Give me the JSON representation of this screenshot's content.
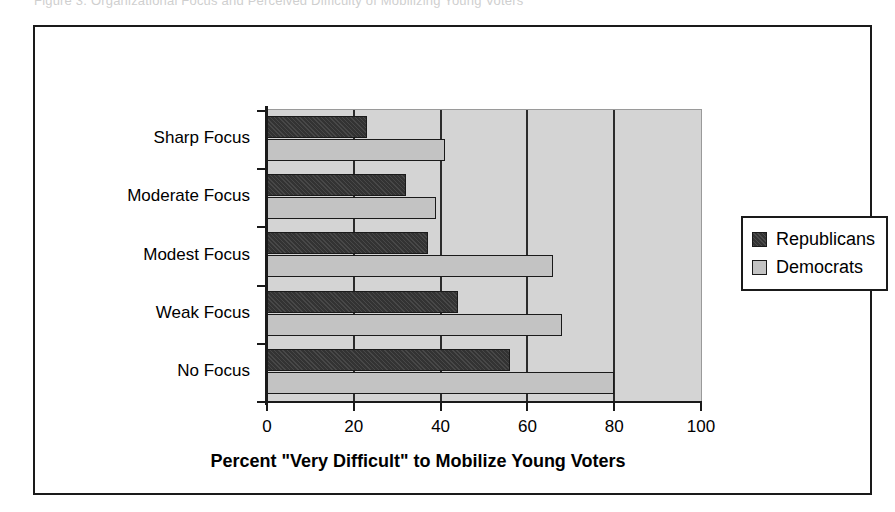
{
  "top_caption": "Figure 3.  Organizational Focus and Perceived Difficulty of Mobilizing Young Voters",
  "chart_data": {
    "type": "bar",
    "orientation": "horizontal",
    "title": "",
    "xlabel": "Percent \"Very Difficult\" to Mobilize Young Voters",
    "ylabel": "",
    "xlim": [
      0,
      100
    ],
    "xticks": [
      0,
      20,
      40,
      60,
      80,
      100
    ],
    "grid": true,
    "grid_axis": "x",
    "legend_position": "right",
    "categories": [
      "Sharp Focus",
      "Moderate Focus",
      "Modest Focus",
      "Weak Focus",
      "No Focus"
    ],
    "series": [
      {
        "name": "Republicans",
        "color": "#333333",
        "values": [
          23,
          32,
          37,
          44,
          56
        ]
      },
      {
        "name": "Democrats",
        "color": "#c3c3c3",
        "values": [
          41,
          39,
          66,
          68,
          80
        ]
      }
    ]
  },
  "axis": {
    "tick_labels": [
      "0",
      "20",
      "40",
      "60",
      "80",
      "100"
    ],
    "title": "Percent \"Very Difficult\" to Mobilize Young Voters"
  },
  "categories": {
    "labels": [
      "Sharp Focus",
      "Moderate Focus",
      "Modest Focus",
      "Weak Focus",
      "No Focus"
    ]
  },
  "legend": {
    "items": [
      {
        "label": "Republicans",
        "swatch": "dark-hatched-swatch"
      },
      {
        "label": "Democrats",
        "swatch": "light-gray-swatch"
      }
    ]
  },
  "colors": {
    "republican": "#333333",
    "democrat": "#c3c3c3",
    "plot_background": "#d4d4d4",
    "axis": "#1a1a1a"
  }
}
